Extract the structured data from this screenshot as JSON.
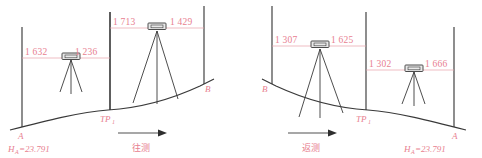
{
  "figure": {
    "type": "leveling-survey-diagram",
    "panels": [
      {
        "id": "forward",
        "caption": "往测",
        "start_point": "A",
        "end_point": "B",
        "turning_point": "TP",
        "turning_point_sub": "1",
        "benchmark_label": "H",
        "benchmark_sub": "A",
        "benchmark_value": "=23.791",
        "setups": [
          {
            "backsight": "1 632",
            "foresight": "1 236"
          },
          {
            "backsight": "1 713",
            "foresight": "1 429"
          }
        ]
      },
      {
        "id": "return",
        "caption": "返测",
        "start_point": "B",
        "end_point": "A",
        "turning_point": "TP",
        "turning_point_sub": "1",
        "benchmark_label": "H",
        "benchmark_sub": "A",
        "benchmark_value": "=23.791",
        "setups": [
          {
            "backsight": "1 307",
            "foresight": "1 625"
          },
          {
            "backsight": "1 302",
            "foresight": "1 666"
          }
        ]
      }
    ],
    "colors": {
      "annotation": "#e8808f",
      "sight_line": "#e8a0ab",
      "ink": "#3a3a3a",
      "arrow": "#8a8a8a"
    }
  }
}
